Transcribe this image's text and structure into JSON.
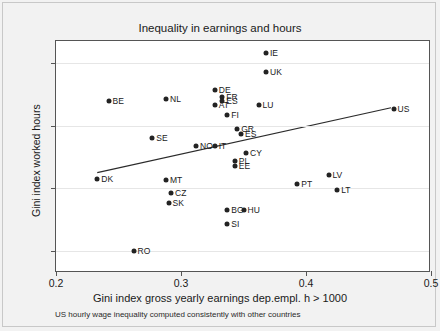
{
  "chart_data": {
    "type": "scatter",
    "title": "Inequality in earnings and hours",
    "xlabel": "Gini index gross yearly earnings dep.empl. h > 1000",
    "ylabel": "Gini index worked hours",
    "caption": "US hourly wage inequality computed consistently with other countries",
    "xlim": [
      0.2,
      0.5
    ],
    "ylim": [
      0.032,
      0.218
    ],
    "xticks": [
      0.2,
      0.3,
      0.4,
      0.5
    ],
    "xticklabels": [
      "0.2",
      "0.3",
      "0.4",
      "0.5"
    ],
    "yticks": [
      0.05,
      0.1,
      0.15,
      0.2
    ],
    "yticklabels": [
      "0.05",
      "0.1",
      "0.15",
      "0.2"
    ],
    "grid": true,
    "legend": "none",
    "points": [
      {
        "label": "IE",
        "x": 0.368,
        "y": 0.2085
      },
      {
        "label": "UK",
        "x": 0.368,
        "y": 0.1935
      },
      {
        "label": "DE",
        "x": 0.327,
        "y": 0.1785
      },
      {
        "label": "FR",
        "x": 0.333,
        "y": 0.1735
      },
      {
        "label": "ES",
        "x": 0.333,
        "y": 0.1695
      },
      {
        "label": "AT",
        "x": 0.327,
        "y": 0.1665
      },
      {
        "label": "NL",
        "x": 0.288,
        "y": 0.1715
      },
      {
        "label": "BE",
        "x": 0.242,
        "y": 0.1695
      },
      {
        "label": "LU",
        "x": 0.362,
        "y": 0.1665
      },
      {
        "label": "FI",
        "x": 0.337,
        "y": 0.1585
      },
      {
        "label": "US",
        "x": 0.47,
        "y": 0.1635
      },
      {
        "label": "GR",
        "x": 0.345,
        "y": 0.1475
      },
      {
        "label": "ES2",
        "x": 0.348,
        "y": 0.1435
      },
      {
        "label": "SE",
        "x": 0.277,
        "y": 0.1405
      },
      {
        "label": "NO",
        "x": 0.312,
        "y": 0.1335
      },
      {
        "label": "IT",
        "x": 0.327,
        "y": 0.1335
      },
      {
        "label": "CY",
        "x": 0.352,
        "y": 0.1285
      },
      {
        "label": "PL",
        "x": 0.343,
        "y": 0.1215
      },
      {
        "label": "EE",
        "x": 0.343,
        "y": 0.1175
      },
      {
        "label": "LV",
        "x": 0.418,
        "y": 0.1105
      },
      {
        "label": "DK",
        "x": 0.233,
        "y": 0.1075
      },
      {
        "label": "MT",
        "x": 0.288,
        "y": 0.1065
      },
      {
        "label": "PT",
        "x": 0.393,
        "y": 0.1035
      },
      {
        "label": "LT",
        "x": 0.425,
        "y": 0.0985
      },
      {
        "label": "CZ",
        "x": 0.292,
        "y": 0.0965
      },
      {
        "label": "SK",
        "x": 0.29,
        "y": 0.0885
      },
      {
        "label": "BG",
        "x": 0.337,
        "y": 0.0825
      },
      {
        "label": "HU",
        "x": 0.35,
        "y": 0.0825
      },
      {
        "label": "SI",
        "x": 0.337,
        "y": 0.0715
      },
      {
        "label": "RO",
        "x": 0.262,
        "y": 0.0495
      }
    ],
    "trendline": {
      "x0": 0.233,
      "y0": 0.1125,
      "x1": 0.468,
      "y1": 0.1645
    }
  }
}
